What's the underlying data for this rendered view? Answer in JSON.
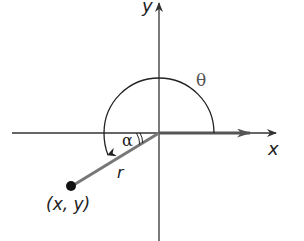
{
  "diagram": {
    "labels": {
      "y_axis": "y",
      "x_axis": "x",
      "theta": "θ",
      "alpha": "α",
      "radius": "r",
      "point": "(x, y)"
    },
    "colors": {
      "axis": "#333333",
      "terminal_side": "#666666",
      "arc": "#222222",
      "point": "#111111",
      "greek_label": "#666666"
    },
    "origin": [
      159,
      133
    ],
    "point_xy": [
      71,
      186
    ]
  }
}
